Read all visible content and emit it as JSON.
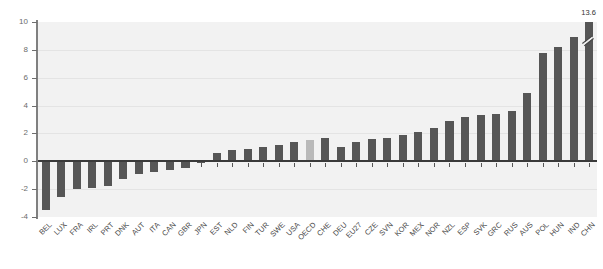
{
  "chart_data": {
    "type": "bar",
    "title": "",
    "xlabel": "",
    "ylabel": "",
    "ylim": [
      -4,
      10
    ],
    "yticks": [
      -4,
      -2,
      0,
      2,
      4,
      6,
      8,
      10
    ],
    "ytick_labels": [
      "-4",
      "-2",
      "0",
      "2",
      "4",
      "6",
      "8",
      "10"
    ],
    "grid": true,
    "legend": "none",
    "highlight_category": "OECD",
    "colors": {
      "bar": "#565656",
      "highlight_bar": "#b9b9b9",
      "plot_background": "#f2f2f2",
      "gridline": "#e4e4e4",
      "axis": "#808080",
      "zero_line": "#3a3a3a",
      "tick_label": "#6b6b6b"
    },
    "annotations": [
      {
        "category": "CHN",
        "text": "13.6",
        "note": "bar truncated with axis-break marker"
      }
    ],
    "categories": [
      "BEL",
      "LUX",
      "FRA",
      "IRL",
      "PRT",
      "DNK",
      "AUT",
      "ITA",
      "CAN",
      "GBR",
      "JPN",
      "EST",
      "NLD",
      "FIN",
      "TUR",
      "SWE",
      "USA",
      "OECD",
      "CHE",
      "DEU",
      "EU27",
      "CZE",
      "SVN",
      "KOR",
      "MEX",
      "NOR",
      "NZL",
      "ESP",
      "SVK",
      "GRC",
      "RUS",
      "AUS",
      "POL",
      "HUN",
      "IND",
      "CHN"
    ],
    "values": [
      -3.5,
      -2.6,
      -2.0,
      -1.9,
      -1.8,
      -1.3,
      -0.9,
      -0.8,
      -0.6,
      -0.5,
      -0.1,
      0.6,
      0.8,
      0.9,
      1.0,
      1.2,
      1.4,
      1.5,
      1.7,
      1.0,
      1.4,
      1.6,
      1.7,
      1.9,
      2.1,
      2.4,
      2.9,
      3.2,
      3.3,
      3.4,
      3.6,
      4.9,
      7.8,
      8.2,
      8.9,
      13.6
    ],
    "display_values": [
      -3.5,
      -2.6,
      -2.0,
      -1.9,
      -1.8,
      -1.3,
      -0.9,
      -0.8,
      -0.6,
      -0.5,
      -0.1,
      0.6,
      0.8,
      0.9,
      1.0,
      1.2,
      1.4,
      1.5,
      1.7,
      1.0,
      1.4,
      1.6,
      1.7,
      1.9,
      2.1,
      2.4,
      2.9,
      3.2,
      3.3,
      3.4,
      3.6,
      4.9,
      7.8,
      8.2,
      8.9,
      10.0
    ]
  }
}
